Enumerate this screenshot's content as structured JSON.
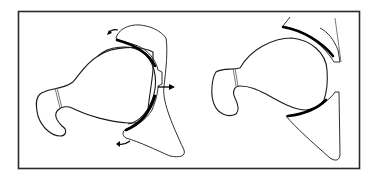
{
  "figure": {
    "panels": [
      {
        "id": "left",
        "state": "with-arrows",
        "arrows": [
          "upper-rotation-arrow",
          "lateral-push-arrow",
          "lower-rotation-arrow"
        ]
      },
      {
        "id": "right",
        "state": "without-arrows",
        "arrows": []
      }
    ]
  },
  "colors": {
    "background": "#ffffff",
    "frame": "#2a2a2a",
    "line": "#1a1a1a",
    "cartilage": "#000000"
  }
}
